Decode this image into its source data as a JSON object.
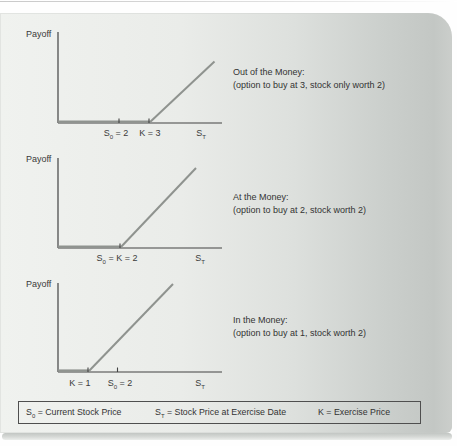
{
  "figure": {
    "charts": [
      {
        "id": "out-of-the-money",
        "y_axis_label": "Payoff",
        "x_axis_end_label": "S_T",
        "tick_labels": [
          "S_0 = 2",
          "K = 3"
        ],
        "annotation": {
          "title": "Out of the Money:",
          "detail": "(option to buy at 3, stock only worth 2)"
        },
        "payoff_line": {
          "exercise_price_K": 3,
          "current_stock_price_S0": 2,
          "shape": "flat at zero until K = 3, then rises"
        }
      },
      {
        "id": "at-the-money",
        "y_axis_label": "Payoff",
        "x_axis_end_label": "S_T",
        "tick_labels": [
          "S_0 = K = 2"
        ],
        "annotation": {
          "title": "At the Money:",
          "detail": "(option to buy at 2, stock worth 2)"
        },
        "payoff_line": {
          "exercise_price_K": 2,
          "current_stock_price_S0": 2,
          "shape": "flat at zero until S_0 = K = 2, then rises"
        }
      },
      {
        "id": "in-the-money",
        "y_axis_label": "Payoff",
        "x_axis_end_label": "S_T",
        "tick_labels": [
          "K = 1",
          "S_0 = 2"
        ],
        "annotation": {
          "title": "In the Money:",
          "detail": "(option to buy at 1, stock worth 2)"
        },
        "payoff_line": {
          "exercise_price_K": 1,
          "current_stock_price_S0": 2,
          "shape": "flat at zero until K = 1, then rises"
        }
      }
    ],
    "legend": {
      "items": [
        "S_0 = Current Stock Price",
        "S_T = Stock Price at Exercise Date",
        "K = Exercise Price"
      ]
    },
    "colors": {
      "panel_left": "#f0f2ef",
      "panel_right": "#c3c7c4",
      "axis": "#424242",
      "payoff_line": "#8f938f",
      "text": "#333333",
      "legend_border": "#4f4f4f"
    }
  }
}
